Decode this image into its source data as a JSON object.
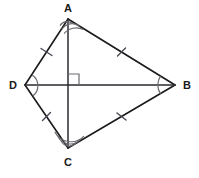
{
  "figure": {
    "name": "kite-abcd-with-perpendicular-diagonals",
    "type": "geometry-diagram",
    "canvas": {
      "width": 199,
      "height": 178,
      "background": "#ffffff"
    },
    "stroke_color": "#1a1a1a",
    "mark_color": "#4a4a55"
  },
  "vertices": [
    {
      "id": "A",
      "label": "A",
      "x": 68,
      "y": 19,
      "label_x": 68,
      "label_y": 12
    },
    {
      "id": "B",
      "label": "B",
      "x": 175,
      "y": 85,
      "label_x": 187,
      "label_y": 89
    },
    {
      "id": "C",
      "label": "C",
      "x": 68,
      "y": 148,
      "label_x": 68,
      "label_y": 166
    },
    {
      "id": "D",
      "label": "D",
      "x": 25,
      "y": 85,
      "label_x": 13,
      "label_y": 89
    }
  ],
  "edges": [
    {
      "id": "DA",
      "from": "D",
      "to": "A",
      "ticks": 1
    },
    {
      "id": "AB",
      "from": "A",
      "to": "B",
      "ticks": 1
    },
    {
      "id": "DC",
      "from": "D",
      "to": "C",
      "ticks": 1
    },
    {
      "id": "CB",
      "from": "C",
      "to": "B",
      "ticks": 1
    }
  ],
  "diagonals": [
    {
      "id": "AC",
      "from": "A",
      "to": "C",
      "orientation": "vertical"
    },
    {
      "id": "DB",
      "from": "D",
      "to": "B",
      "orientation": "horizontal"
    }
  ],
  "intersection": {
    "id": "O",
    "x": 68,
    "y": 85
  },
  "right_angle": {
    "at": "O",
    "quadrant": "upper-right",
    "size": 11,
    "label": "right-angle"
  },
  "angle_marks": [
    {
      "at": "A",
      "arcs": 2,
      "note": "double arc between AD and AC"
    },
    {
      "at": "C",
      "arcs": 2,
      "note": "double arc between CD and CA"
    },
    {
      "at": "D",
      "arcs": 1,
      "note": "single arc between DA and DC"
    },
    {
      "at": "B",
      "arcs": 1,
      "note": "single arc between BA and BC"
    }
  ]
}
